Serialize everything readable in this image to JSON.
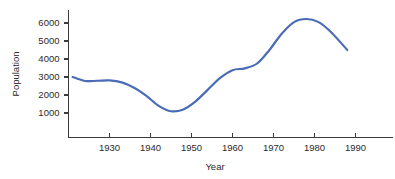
{
  "chart_data": {
    "type": "line",
    "title": "",
    "xlabel": "Year",
    "ylabel": "Population",
    "xlim": [
      1920,
      2000
    ],
    "ylim": [
      0,
      6600
    ],
    "grid": false,
    "legend": false,
    "series_color": "#4a6bb5",
    "axis_color": "#3b3b3b",
    "xticks": [
      1930,
      1940,
      1950,
      1960,
      1970,
      1980,
      1990
    ],
    "xtick_labels": [
      "1930",
      "1940",
      "1950",
      "1960",
      "1970",
      "1980",
      "1990"
    ],
    "yticks": [
      1000,
      2000,
      3000,
      4000,
      5000,
      6000
    ],
    "ytick_labels": [
      "1000",
      "2000",
      "3000",
      "4000",
      "5000",
      "6000"
    ],
    "series": [
      {
        "name": "Population",
        "x": [
          1921,
          1924,
          1927,
          1930,
          1933,
          1936,
          1939,
          1942,
          1945,
          1948,
          1951,
          1954,
          1957,
          1960,
          1963,
          1966,
          1969,
          1972,
          1975,
          1978,
          1981,
          1984,
          1988
        ],
        "values": [
          3000,
          2780,
          2790,
          2810,
          2700,
          2400,
          1950,
          1400,
          1100,
          1200,
          1650,
          2300,
          2950,
          3380,
          3480,
          3750,
          4500,
          5400,
          6050,
          6220,
          6050,
          5500,
          4500
        ]
      }
    ]
  },
  "axis_labels": {
    "x_title": "Year",
    "y_title": "Population"
  }
}
